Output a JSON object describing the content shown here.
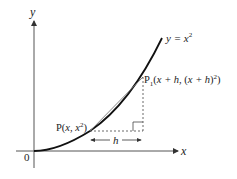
{
  "figure": {
    "axes": {
      "x_label": "x",
      "y_label": "y",
      "origin_label": "0"
    },
    "curve": {
      "label_prefix": "y = ",
      "label_var": "x",
      "label_exp": "2"
    },
    "point_p": {
      "name": "P",
      "coords_open": "(",
      "x": "x",
      "sep": ", ",
      "y_var": "x",
      "y_exp": "2",
      "coords_close": ")"
    },
    "point_p1": {
      "name": "P",
      "subscript": "1",
      "coords_open": "(",
      "x": "x + h",
      "sep": ", (",
      "y": "x + h",
      "y_close": ")",
      "y_exp": "2",
      "coords_close": ")"
    },
    "increment": {
      "label": "h"
    },
    "colors": {
      "ink": "#222222",
      "axis": "#555555",
      "secant": "#777777"
    }
  }
}
